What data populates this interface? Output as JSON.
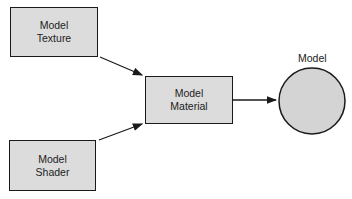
{
  "diagram": {
    "nodes": {
      "texture": {
        "line1": "Model",
        "line2": "Texture"
      },
      "shader": {
        "line1": "Model",
        "line2": "Shader"
      },
      "material": {
        "line1": "Model",
        "line2": "Material"
      },
      "model": {
        "label": "Model"
      }
    },
    "edges": [
      {
        "from": "texture",
        "to": "material"
      },
      {
        "from": "shader",
        "to": "material"
      },
      {
        "from": "material",
        "to": "model"
      }
    ],
    "colors": {
      "fill": "#dcdcdc",
      "stroke": "#1a1a1a"
    }
  }
}
